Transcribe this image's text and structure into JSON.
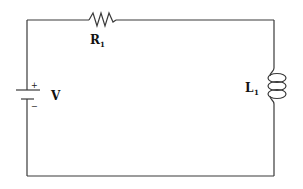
{
  "diagram": {
    "type": "circuit",
    "topology": "series RL circuit",
    "components": [
      {
        "id": "V",
        "kind": "battery",
        "label": "V",
        "positive_sign": "+",
        "negative_sign": "−"
      },
      {
        "id": "R1",
        "kind": "resistor",
        "label_main": "R",
        "label_sub": "1"
      },
      {
        "id": "L1",
        "kind": "inductor",
        "label_main": "L",
        "label_sub": "1"
      }
    ],
    "connections": [
      [
        "V+",
        "R1"
      ],
      [
        "R1",
        "L1"
      ],
      [
        "L1",
        "V-"
      ]
    ],
    "colors": {
      "wire": "#3a3a3a",
      "text": "#111111",
      "background": "#ffffff"
    }
  }
}
